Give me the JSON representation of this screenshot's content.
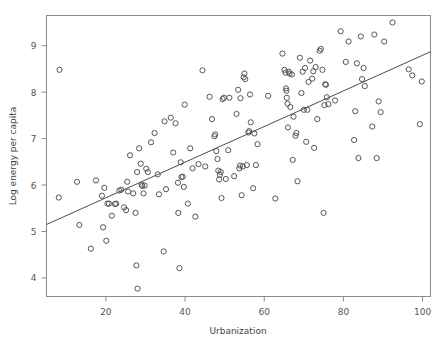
{
  "chart_data": {
    "type": "scatter",
    "title": "",
    "xlabel": "Urbanization",
    "ylabel": "Log energy per capita",
    "xlim": [
      5,
      102
    ],
    "ylim": [
      3.6,
      9.65
    ],
    "xticks": [
      20,
      40,
      60,
      80,
      100
    ],
    "yticks": [
      4,
      5,
      6,
      7,
      8,
      9
    ],
    "xtick_labels": [
      "20",
      "40",
      "60",
      "80",
      "100"
    ],
    "ytick_labels": [
      "4",
      "5",
      "6",
      "7",
      "8",
      "9"
    ],
    "grid": false,
    "legend": "none",
    "marker": "open-circle",
    "marker_color": "#555555",
    "fit_line": {
      "type": "linear-regression",
      "x_start": 5,
      "y_start": 5.15,
      "x_end": 102,
      "y_end": 8.87,
      "color": "#4c4c4c"
    },
    "points": [
      [
        8.3,
        8.48
      ],
      [
        8.1,
        5.73
      ],
      [
        12.7,
        6.07
      ],
      [
        13.3,
        5.14
      ],
      [
        16.2,
        4.63
      ],
      [
        17.5,
        6.1
      ],
      [
        19.0,
        5.77
      ],
      [
        19.3,
        5.09
      ],
      [
        19.6,
        5.94
      ],
      [
        20.1,
        4.8
      ],
      [
        20.4,
        5.6
      ],
      [
        20.8,
        5.6
      ],
      [
        21.5,
        5.34
      ],
      [
        22.3,
        5.59
      ],
      [
        22.6,
        5.6
      ],
      [
        23.4,
        5.88
      ],
      [
        23.9,
        5.9
      ],
      [
        24.6,
        5.52
      ],
      [
        25.1,
        5.46
      ],
      [
        25.4,
        6.07
      ],
      [
        25.6,
        5.86
      ],
      [
        26.1,
        6.64
      ],
      [
        26.9,
        5.82
      ],
      [
        27.5,
        5.4
      ],
      [
        27.7,
        4.27
      ],
      [
        27.9,
        6.28
      ],
      [
        28.0,
        3.77
      ],
      [
        28.4,
        6.79
      ],
      [
        28.8,
        6.46
      ],
      [
        29.0,
        6.01
      ],
      [
        29.2,
        5.98
      ],
      [
        29.5,
        5.82
      ],
      [
        29.8,
        5.99
      ],
      [
        30.2,
        6.35
      ],
      [
        30.6,
        6.28
      ],
      [
        31.4,
        6.92
      ],
      [
        32.3,
        7.12
      ],
      [
        33.1,
        6.23
      ],
      [
        33.4,
        5.8
      ],
      [
        34.6,
        4.57
      ],
      [
        34.8,
        7.37
      ],
      [
        35.2,
        5.91
      ],
      [
        36.4,
        7.45
      ],
      [
        37.0,
        6.7
      ],
      [
        37.6,
        7.33
      ],
      [
        38.2,
        6.05
      ],
      [
        38.3,
        5.4
      ],
      [
        38.6,
        4.21
      ],
      [
        38.9,
        6.49
      ],
      [
        39.1,
        6.17
      ],
      [
        39.4,
        6.18
      ],
      [
        39.7,
        5.96
      ],
      [
        39.9,
        7.73
      ],
      [
        40.7,
        5.6
      ],
      [
        41.3,
        6.79
      ],
      [
        41.9,
        6.36
      ],
      [
        42.6,
        5.32
      ],
      [
        43.4,
        6.45
      ],
      [
        44.4,
        8.47
      ],
      [
        45.1,
        6.4
      ],
      [
        46.2,
        7.9
      ],
      [
        46.8,
        7.42
      ],
      [
        47.4,
        7.05
      ],
      [
        47.6,
        7.09
      ],
      [
        47.9,
        6.73
      ],
      [
        48.2,
        6.56
      ],
      [
        48.4,
        6.31
      ],
      [
        48.6,
        6.12
      ],
      [
        48.8,
        6.22
      ],
      [
        49.0,
        6.28
      ],
      [
        49.2,
        5.72
      ],
      [
        49.5,
        7.85
      ],
      [
        49.8,
        7.88
      ],
      [
        50.3,
        6.13
      ],
      [
        50.9,
        6.75
      ],
      [
        51.2,
        7.88
      ],
      [
        52.4,
        6.19
      ],
      [
        53.0,
        7.53
      ],
      [
        53.4,
        8.05
      ],
      [
        53.7,
        6.36
      ],
      [
        53.9,
        6.42
      ],
      [
        54.0,
        7.87
      ],
      [
        54.3,
        5.78
      ],
      [
        54.6,
        6.4
      ],
      [
        54.8,
        8.32
      ],
      [
        55.0,
        8.4
      ],
      [
        55.2,
        8.28
      ],
      [
        55.6,
        6.43
      ],
      [
        56.0,
        7.13
      ],
      [
        56.2,
        7.16
      ],
      [
        56.4,
        7.95
      ],
      [
        56.6,
        7.35
      ],
      [
        57.2,
        5.93
      ],
      [
        57.5,
        7.11
      ],
      [
        57.9,
        6.43
      ],
      [
        58.3,
        6.88
      ],
      [
        61.0,
        7.92
      ],
      [
        62.8,
        5.71
      ],
      [
        64.6,
        8.83
      ],
      [
        65.1,
        8.48
      ],
      [
        65.4,
        8.42
      ],
      [
        65.5,
        8.08
      ],
      [
        65.6,
        8.03
      ],
      [
        65.7,
        7.88
      ],
      [
        65.9,
        7.75
      ],
      [
        66.0,
        7.24
      ],
      [
        66.2,
        8.44
      ],
      [
        66.4,
        8.4
      ],
      [
        66.6,
        7.68
      ],
      [
        67.0,
        8.38
      ],
      [
        67.2,
        6.54
      ],
      [
        67.4,
        7.47
      ],
      [
        67.9,
        7.06
      ],
      [
        68.1,
        7.12
      ],
      [
        68.4,
        6.08
      ],
      [
        69.0,
        8.74
      ],
      [
        69.4,
        7.98
      ],
      [
        69.7,
        8.44
      ],
      [
        70.0,
        7.62
      ],
      [
        70.3,
        8.52
      ],
      [
        70.6,
        6.93
      ],
      [
        70.9,
        7.62
      ],
      [
        71.2,
        8.22
      ],
      [
        71.6,
        8.68
      ],
      [
        72.1,
        8.29
      ],
      [
        72.4,
        8.45
      ],
      [
        72.6,
        6.8
      ],
      [
        73.0,
        8.54
      ],
      [
        73.4,
        7.42
      ],
      [
        74.0,
        8.89
      ],
      [
        74.3,
        8.93
      ],
      [
        74.7,
        8.48
      ],
      [
        75.0,
        5.4
      ],
      [
        75.2,
        7.72
      ],
      [
        75.4,
        8.17
      ],
      [
        75.6,
        8.16
      ],
      [
        75.8,
        7.89
      ],
      [
        76.2,
        7.74
      ],
      [
        77.9,
        7.82
      ],
      [
        79.3,
        9.31
      ],
      [
        80.6,
        8.65
      ],
      [
        81.3,
        9.09
      ],
      [
        82.7,
        6.97
      ],
      [
        83.0,
        7.59
      ],
      [
        83.4,
        8.62
      ],
      [
        83.8,
        6.58
      ],
      [
        84.4,
        9.2
      ],
      [
        84.7,
        8.28
      ],
      [
        85.1,
        8.52
      ],
      [
        85.4,
        8.13
      ],
      [
        87.3,
        7.26
      ],
      [
        87.8,
        9.24
      ],
      [
        88.4,
        6.58
      ],
      [
        88.9,
        7.8
      ],
      [
        89.4,
        7.57
      ],
      [
        90.3,
        9.09
      ],
      [
        92.4,
        9.5
      ],
      [
        96.5,
        8.49
      ],
      [
        97.4,
        8.36
      ],
      [
        99.3,
        7.31
      ],
      [
        99.8,
        8.23
      ]
    ]
  },
  "axis": {
    "x_axis_name": "x-axis",
    "y_axis_name": "y-axis"
  }
}
